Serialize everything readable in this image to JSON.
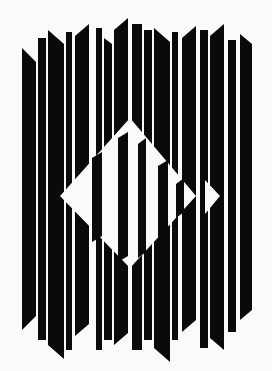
{
  "artwork": {
    "background": "#fbfbfb",
    "ink": "#0a0a0a",
    "paper": "#fbfbfb",
    "width": 272,
    "height": 371,
    "columns": [
      {
        "x": 22,
        "w": 14,
        "top": 48,
        "bottom": 330,
        "topSlope": 14,
        "botSlope": -14
      },
      {
        "x": 38,
        "w": 8,
        "top": 38,
        "bottom": 340,
        "topSlope": 0,
        "botSlope": 0
      },
      {
        "x": 48,
        "w": 16,
        "top": 30,
        "bottom": 345,
        "topSlope": 14,
        "botSlope": 14
      },
      {
        "x": 66,
        "w": 6,
        "top": 32,
        "bottom": 350,
        "topSlope": 0,
        "botSlope": 0
      },
      {
        "x": 75,
        "w": 14,
        "top": 36,
        "bottom": 336,
        "topSlope": -12,
        "botSlope": -12
      },
      {
        "x": 96,
        "w": 6,
        "top": 28,
        "bottom": 350,
        "topSlope": 0,
        "botSlope": 0
      },
      {
        "x": 104,
        "w": 8,
        "top": 38,
        "bottom": 340,
        "topSlope": 6,
        "botSlope": 0
      },
      {
        "x": 114,
        "w": 14,
        "top": 30,
        "bottom": 345,
        "topSlope": -12,
        "botSlope": -12
      },
      {
        "x": 132,
        "w": 10,
        "top": 24,
        "bottom": 350,
        "topSlope": 0,
        "botSlope": 0
      },
      {
        "x": 144,
        "w": 8,
        "top": 30,
        "bottom": 340,
        "topSlope": 0,
        "botSlope": 0
      },
      {
        "x": 154,
        "w": 16,
        "top": 28,
        "bottom": 348,
        "topSlope": 14,
        "botSlope": 14
      },
      {
        "x": 172,
        "w": 6,
        "top": 32,
        "bottom": 340,
        "topSlope": 0,
        "botSlope": 0
      },
      {
        "x": 182,
        "w": 14,
        "top": 38,
        "bottom": 332,
        "topSlope": -12,
        "botSlope": -12
      },
      {
        "x": 200,
        "w": 8,
        "top": 30,
        "bottom": 348,
        "topSlope": 0,
        "botSlope": 0
      },
      {
        "x": 210,
        "w": 14,
        "top": 36,
        "bottom": 338,
        "topSlope": -12,
        "botSlope": 12
      },
      {
        "x": 228,
        "w": 8,
        "top": 40,
        "bottom": 332,
        "topSlope": 0,
        "botSlope": 0
      },
      {
        "x": 240,
        "w": 12,
        "top": 34,
        "bottom": 320,
        "topSlope": 10,
        "botSlope": -10
      }
    ],
    "diamond": {
      "points": "130,118 196,196 130,268 60,196",
      "innerBars": [
        {
          "x": 92,
          "w": 10,
          "top": 152,
          "bottom": 242
        },
        {
          "x": 118,
          "w": 10,
          "top": 132,
          "bottom": 262
        },
        {
          "x": 138,
          "w": 8,
          "top": 138,
          "bottom": 258
        },
        {
          "x": 158,
          "w": 10,
          "top": 160,
          "bottom": 240
        },
        {
          "x": 176,
          "w": 8,
          "top": 178,
          "bottom": 218
        }
      ]
    },
    "rightNotch": {
      "points": "205,180 220,196 205,214"
    }
  }
}
